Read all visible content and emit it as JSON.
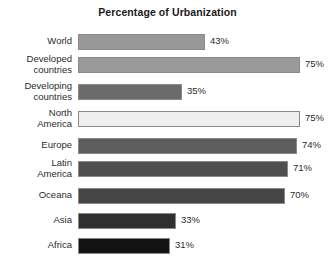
{
  "chart_data": {
    "type": "bar",
    "title": "Percentage of Urbanization",
    "xlabel": "",
    "ylabel": "",
    "orientation": "horizontal",
    "grid": false,
    "legend": false,
    "xlim": [
      0,
      75
    ],
    "value_suffix": "%",
    "categories": [
      "World",
      "Developed countries",
      "Developing countries",
      "North America",
      "Europe",
      "Latin America",
      "Oceana",
      "Asia",
      "Africa"
    ],
    "values": [
      43,
      75,
      35,
      75,
      74,
      71,
      70,
      33,
      31
    ],
    "value_labels": [
      "43%",
      "75%",
      "35%",
      "75%",
      "74%",
      "71%",
      "70%",
      "33%",
      "31%"
    ],
    "bars": [
      {
        "label_lines": [
          "World"
        ],
        "value": 43,
        "value_label": "43%",
        "color": "#989898"
      },
      {
        "label_lines": [
          "Developed",
          "countries"
        ],
        "value": 75,
        "value_label": "75%",
        "color": "#9a9a9a"
      },
      {
        "label_lines": [
          "Developing",
          "countries"
        ],
        "value": 35,
        "value_label": "35%",
        "color": "#6b6b6b"
      },
      {
        "label_lines": [
          "North",
          "America"
        ],
        "value": 75,
        "value_label": "75%",
        "color": "#efefef"
      },
      {
        "label_lines": [
          "Europe"
        ],
        "value": 74,
        "value_label": "74%",
        "color": "#5d5d5d"
      },
      {
        "label_lines": [
          "Latin",
          "America"
        ],
        "value": 71,
        "value_label": "71%",
        "color": "#4f4f4f"
      },
      {
        "label_lines": [
          "Oceana"
        ],
        "value": 70,
        "value_label": "70%",
        "color": "#454545"
      },
      {
        "label_lines": [
          "Asia"
        ],
        "value": 33,
        "value_label": "33%",
        "color": "#303030"
      },
      {
        "label_lines": [
          "Africa"
        ],
        "value": 31,
        "value_label": "31%",
        "color": "#121212"
      }
    ]
  },
  "colors": {
    "background": "#ffffff",
    "text": "#2b2b2b",
    "title": "#1a1a1a",
    "bar_border": "#8a8a8a"
  }
}
